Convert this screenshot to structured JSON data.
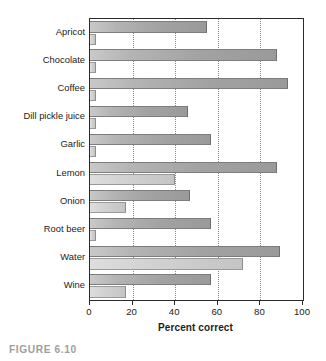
{
  "caption": "FIGURE 6.10",
  "chart_data": {
    "type": "bar",
    "orientation": "horizontal",
    "title": "",
    "xlabel": "Percent correct",
    "ylabel": "",
    "xlim": [
      0,
      100
    ],
    "xticks": [
      0,
      20,
      40,
      60,
      80,
      100
    ],
    "xtick_labels": [
      "0",
      "20",
      "40",
      "60",
      "80",
      "100"
    ],
    "grid": "vertical-dotted",
    "legend": "none",
    "categories": [
      "Apricot",
      "Chocolate",
      "Coffee",
      "Dill pickle juice",
      "Garlic",
      "Lemon",
      "Onion",
      "Root beer",
      "Water",
      "Wine"
    ],
    "series": [
      {
        "name": "Series 1",
        "color": "#a8a8a8",
        "values": [
          55,
          88,
          93,
          46,
          57,
          88,
          47,
          57,
          89,
          57
        ]
      },
      {
        "name": "Series 2",
        "color": "#d2d2d2",
        "values": [
          3,
          3,
          3,
          3,
          3,
          40,
          17,
          3,
          72,
          17
        ]
      }
    ]
  },
  "colors": {
    "frame": "#2b2b2b",
    "grid": "#8a8a8a",
    "bar_primary": "#a8a8a8",
    "bar_secondary": "#d2d2d2",
    "text": "#232323",
    "caption": "#9e9e9e",
    "background": "#ffffff"
  }
}
